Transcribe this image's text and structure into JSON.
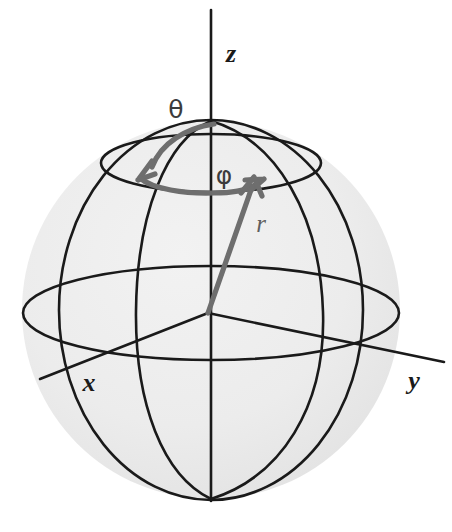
{
  "figure": {
    "background_color": "#ffffff"
  },
  "sphere": {
    "name": "shaded-sphere",
    "center_x": 211,
    "center_y": 310,
    "radius": 189,
    "fill_color": "#ebebeb",
    "outline_color": "#1a1a1a"
  },
  "axes": [
    {
      "id": "z",
      "label": "z",
      "label_x": 226,
      "label_y": 62,
      "x1": 211,
      "y1": 10,
      "x2": 211,
      "y2": 500,
      "color": "#1a1a1a"
    },
    {
      "id": "x",
      "label": "x",
      "label_x": 89,
      "label_y": 390,
      "x1": 208,
      "y1": 313,
      "x2": 38,
      "y2": 380,
      "color": "#1a1a1a"
    },
    {
      "id": "y",
      "label": "y",
      "label_x": 414,
      "label_y": 388,
      "x1": 208,
      "y1": 313,
      "x2": 442,
      "y2": 363,
      "color": "#1a1a1a"
    }
  ],
  "angles": [
    {
      "id": "theta",
      "label": "θ",
      "label_x": 176,
      "label_y": 117,
      "description": "polar angle from z-axis",
      "color": "#6e6e6e"
    },
    {
      "id": "phi",
      "label": "φ",
      "label_x": 213,
      "label_y": 183,
      "description": "azimuthal angle in xy-plane",
      "color": "#6e6e6e"
    }
  ],
  "vector": {
    "id": "r",
    "label": "r",
    "label_x": 262,
    "label_y": 228,
    "origin_x": 208,
    "origin_y": 313,
    "tip_x": 254,
    "tip_y": 181,
    "color": "#6e6e6e"
  },
  "curves": {
    "equator_label": "equator-ellipse",
    "latitude_label": "latitude-circle",
    "meridian_front_label": "meridian-front",
    "meridian_side_label": "meridian-side",
    "stroke_color": "#1a1a1a"
  }
}
